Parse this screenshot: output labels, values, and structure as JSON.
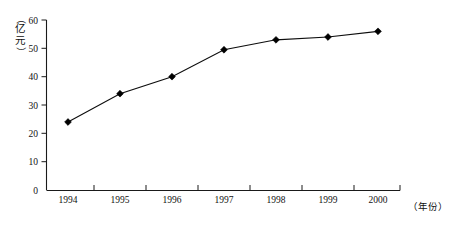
{
  "chart_data": {
    "type": "line",
    "title": "",
    "xlabel": "（年份）",
    "ylabel": "（亿元）",
    "ylabel_chars": [
      "（",
      "亿",
      "元",
      "）"
    ],
    "categories": [
      "1994",
      "1995",
      "1996",
      "1997",
      "1998",
      "1999",
      "2000"
    ],
    "values": [
      24,
      34,
      40,
      49.5,
      53,
      54,
      56
    ],
    "series": [
      {
        "name": "",
        "values": [
          24,
          34,
          40,
          49.5,
          53,
          54,
          56
        ]
      }
    ],
    "ylim": [
      0,
      60
    ],
    "yticks": [
      0,
      10,
      20,
      30,
      40,
      50,
      60
    ],
    "ytick_labels": [
      "0",
      "10",
      "20",
      "30",
      "40",
      "50",
      "60"
    ],
    "xtick_labels": [
      "1994",
      "1995",
      "1996",
      "1997",
      "1998",
      "1999",
      "2000"
    ],
    "grid": false,
    "legend": false,
    "marker": "diamond",
    "line_color": "#000000",
    "marker_color": "#000000",
    "axis_color": "#1a1a1a",
    "background": "#ffffff"
  }
}
